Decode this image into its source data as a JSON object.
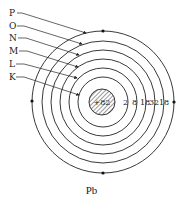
{
  "diagram": {
    "title": "Pb",
    "element": "Pb",
    "nucleus": {
      "label": "+82"
    },
    "shells": [
      {
        "name": "K",
        "electrons": "2"
      },
      {
        "name": "L",
        "electrons": "8"
      },
      {
        "name": "M",
        "electrons": "18"
      },
      {
        "name": "N",
        "electrons": "32"
      },
      {
        "name": "O",
        "electrons": "18"
      },
      {
        "name": "P",
        "electrons": ""
      }
    ],
    "shell_labels": [
      "P",
      "O",
      "N",
      "M",
      "L",
      "K"
    ],
    "electron_counts": [
      "2",
      "8",
      "18",
      "32",
      "18"
    ],
    "colors": {
      "line": "#222222",
      "background": "#ffffff"
    }
  }
}
